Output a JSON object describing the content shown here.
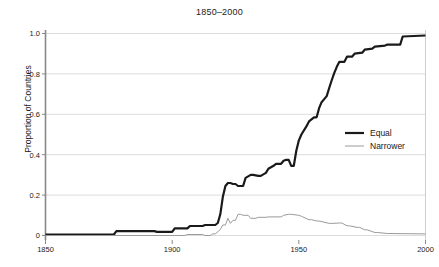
{
  "chart_data": {
    "type": "line",
    "title": "1850–2000",
    "xlabel": "",
    "ylabel": "Proportion of Countries",
    "xlim": [
      1850,
      2000
    ],
    "ylim": [
      0,
      1.0
    ],
    "xticks": [
      1850,
      1900,
      1950,
      2000
    ],
    "xtick_labels": [
      "1850",
      "1900",
      "1950",
      "2000"
    ],
    "yticks": [
      0,
      0.2,
      0.4,
      0.6,
      0.8,
      1.0
    ],
    "ytick_labels": [
      "0",
      "0.2",
      "0.4",
      "0.6",
      "0.8",
      "1.0"
    ],
    "grid": true,
    "grid_axis": "y",
    "legend_position": "center-right",
    "series": [
      {
        "name": "Equal",
        "color": "#1a1a1a",
        "width": 2.2,
        "x": [
          1850,
          1877,
          1878,
          1893,
          1894,
          1900,
          1901,
          1906,
          1907,
          1912,
          1913,
          1917,
          1918,
          1919,
          1920,
          1921,
          1922,
          1923,
          1924,
          1925,
          1926,
          1928,
          1929,
          1931,
          1932,
          1934,
          1935,
          1937,
          1938,
          1940,
          1941,
          1943,
          1944,
          1945,
          1946,
          1947,
          1948,
          1949,
          1950,
          1951,
          1953,
          1954,
          1956,
          1957,
          1958,
          1959,
          1960,
          1961,
          1962,
          1963,
          1964,
          1965,
          1966,
          1968,
          1969,
          1971,
          1972,
          1975,
          1976,
          1979,
          1980,
          1984,
          1985,
          1990,
          1991,
          2000
        ],
        "y": [
          0.005,
          0.005,
          0.022,
          0.022,
          0.018,
          0.018,
          0.035,
          0.035,
          0.047,
          0.047,
          0.052,
          0.052,
          0.062,
          0.105,
          0.19,
          0.245,
          0.26,
          0.26,
          0.255,
          0.255,
          0.245,
          0.245,
          0.285,
          0.3,
          0.3,
          0.295,
          0.295,
          0.31,
          0.33,
          0.345,
          0.355,
          0.355,
          0.37,
          0.375,
          0.375,
          0.345,
          0.345,
          0.42,
          0.47,
          0.5,
          0.54,
          0.565,
          0.585,
          0.585,
          0.63,
          0.66,
          0.675,
          0.69,
          0.73,
          0.77,
          0.805,
          0.835,
          0.86,
          0.86,
          0.885,
          0.885,
          0.9,
          0.905,
          0.92,
          0.925,
          0.935,
          0.94,
          0.945,
          0.945,
          0.985,
          0.99
        ]
      },
      {
        "name": "Narrower",
        "color": "#9a9a9a",
        "width": 1.0,
        "x": [
          1850,
          1900,
          1901,
          1905,
          1906,
          1912,
          1913,
          1915,
          1916,
          1917,
          1918,
          1919,
          1920,
          1921,
          1922,
          1923,
          1924,
          1925,
          1926,
          1927,
          1928,
          1930,
          1931,
          1933,
          1934,
          1937,
          1938,
          1943,
          1944,
          1946,
          1947,
          1950,
          1951,
          1954,
          1955,
          1957,
          1958,
          1962,
          1963,
          1966,
          1967,
          1969,
          1970,
          1973,
          1974,
          1976,
          1977,
          1980,
          1981,
          1985,
          1986,
          2000
        ],
        "y": [
          0.0,
          0.0,
          0.0,
          0.0,
          0.005,
          0.005,
          0.0,
          0.0,
          0.008,
          0.008,
          0.018,
          0.03,
          0.052,
          0.052,
          0.085,
          0.06,
          0.075,
          0.075,
          0.105,
          0.105,
          0.1,
          0.1,
          0.085,
          0.085,
          0.09,
          0.09,
          0.092,
          0.092,
          0.1,
          0.105,
          0.105,
          0.1,
          0.095,
          0.078,
          0.078,
          0.072,
          0.072,
          0.06,
          0.06,
          0.062,
          0.062,
          0.048,
          0.048,
          0.04,
          0.04,
          0.028,
          0.028,
          0.015,
          0.015,
          0.01,
          0.01,
          0.008
        ]
      }
    ]
  },
  "legend": {
    "items": [
      {
        "label": "Equal"
      },
      {
        "label": "Narrower"
      }
    ]
  },
  "axes": {
    "y_axis_title": "Proportion of Countries"
  }
}
